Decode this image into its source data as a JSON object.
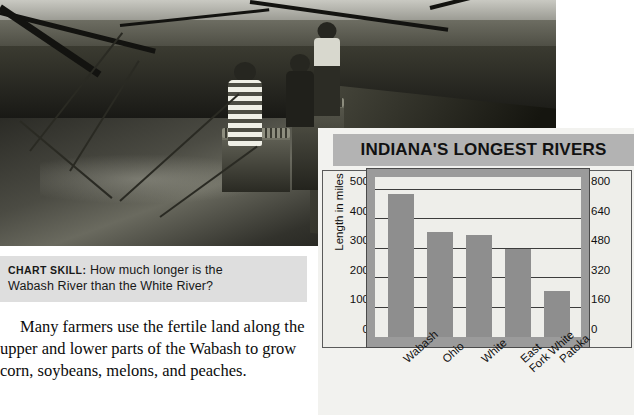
{
  "photo": {
    "alt": "black-and-white photograph of people standing on a stone ledge above a river with baskets of produce"
  },
  "chart_skill": {
    "kicker": "CHART SKILL:",
    "question": "How much longer is the",
    "question_line2": "Wabash River than the White River?"
  },
  "body": {
    "paragraph": "Many farmers use the fertile land along the upper and lower parts of the Wabash to grow corn, soybeans, melons, and peaches."
  },
  "chart_data": {
    "type": "bar",
    "title": "INDIANA'S LONGEST RIVERS",
    "categories": [
      "Wabash",
      "Ohio",
      "White",
      "East\nFork White",
      "Patoka"
    ],
    "values": [
      485,
      357,
      347,
      300,
      155
    ],
    "values_km": [
      776,
      571,
      555,
      480,
      248
    ],
    "xlabel": "",
    "ylabel": "Length in miles",
    "ylabel_right": "Length in kilometers",
    "ylim": [
      0,
      550
    ],
    "yticks": [
      0,
      100,
      200,
      300,
      400,
      500
    ],
    "yticks_right": [
      0,
      160,
      320,
      480,
      640,
      800
    ],
    "grid": true,
    "legend": "none",
    "bar_color": "#8e8e8e",
    "plot_bg": "#eeeeea",
    "frame_color": "#9b9b9b",
    "title_band_color": "#b3b3b3"
  }
}
